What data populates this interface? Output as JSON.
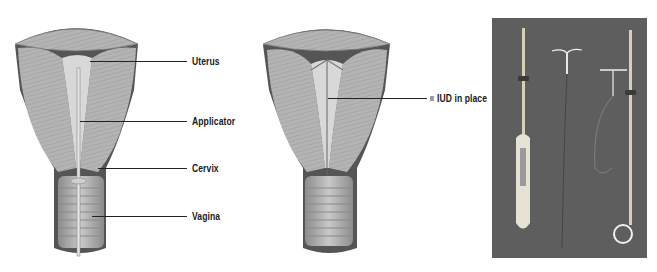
{
  "figure": {
    "panels": [
      {
        "id": "insertion",
        "title": "IUD insertion with applicator",
        "labels": [
          {
            "text": "Uterus",
            "y": 61
          },
          {
            "text": "Applicator",
            "y": 121
          },
          {
            "text": "Cervix",
            "y": 168
          },
          {
            "text": "Vagina",
            "y": 216
          }
        ]
      },
      {
        "id": "in-place",
        "title": "IUD in place",
        "labels": [
          {
            "text": "IUD in place",
            "y": 98
          }
        ]
      },
      {
        "id": "photo",
        "title": "Photograph of two IUDs with inserters",
        "items": [
          "inserter-handle",
          "copper-t-iud",
          "t-shaped-iud",
          "loop-inserter"
        ]
      }
    ],
    "colors": {
      "tissue_light": "#d4d4d4",
      "tissue_mid": "#a9a9a9",
      "tissue_dark": "#5a5a5a",
      "photo_bg": "#5e5e5e",
      "label_text": "#1a1a1a"
    }
  }
}
